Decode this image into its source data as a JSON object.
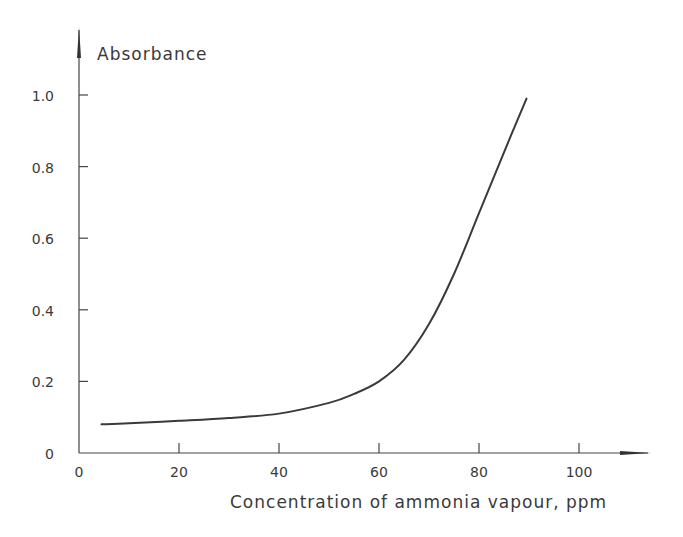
{
  "chart_data": {
    "type": "line",
    "title": "",
    "xlabel": "Concentration of ammonia vapour, ppm",
    "ylabel": "Absorbance",
    "xlim": [
      0,
      113
    ],
    "ylim": [
      0,
      1.1
    ],
    "x_ticks": [
      0,
      20,
      40,
      60,
      80,
      100
    ],
    "x_tick_labels": [
      "0",
      "20",
      "40",
      "60",
      "80",
      "100"
    ],
    "y_ticks": [
      0,
      0.2,
      0.4,
      0.6,
      0.8,
      1.0
    ],
    "y_tick_labels": [
      "0",
      "0.2",
      "0.4",
      "0.6",
      "0.8",
      "1.0"
    ],
    "grid": false,
    "legend": null,
    "series": [
      {
        "name": "Absorbance",
        "x": [
          4.5,
          10,
          20,
          30,
          40,
          50,
          55,
          60,
          65,
          70,
          75,
          80,
          85,
          89.5
        ],
        "y": [
          0.08,
          0.083,
          0.09,
          0.098,
          0.11,
          0.14,
          0.165,
          0.2,
          0.26,
          0.36,
          0.5,
          0.67,
          0.84,
          0.99
        ]
      }
    ]
  },
  "axes": {
    "x_origin_label": "0"
  }
}
